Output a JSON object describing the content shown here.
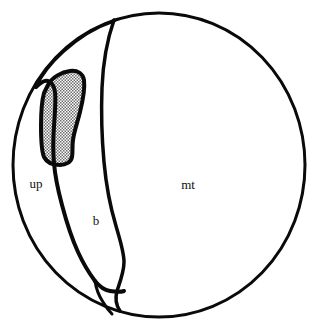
{
  "figure": {
    "kind": "line-drawing",
    "background_color": "#ffffff",
    "stroke_color": "#0a0a0a",
    "shading_color": "#9b9b9b",
    "outer_boundary": {
      "name": "outer-circle",
      "center_x": 159,
      "center_y": 165,
      "radius_x": 146,
      "radius_y": 152,
      "stroke_width": 3
    },
    "labels": [
      {
        "id": "up",
        "text": "up",
        "x": 36,
        "y": 185
      },
      {
        "id": "b",
        "text": "b",
        "x": 96,
        "y": 222
      },
      {
        "id": "mt",
        "text": "mt",
        "x": 188,
        "y": 186
      }
    ],
    "regions": [
      {
        "id": "up",
        "label": "up",
        "shaded": false
      },
      {
        "id": "b",
        "label": "b",
        "shaded": false
      },
      {
        "id": "mt",
        "label": "mt",
        "shaded": false
      },
      {
        "id": "inclusion",
        "label": "",
        "shaded": true
      }
    ]
  }
}
